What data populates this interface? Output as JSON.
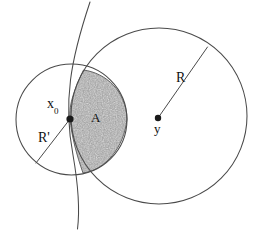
{
  "figure": {
    "background_color": "#ffffff",
    "stroke_color": "#4a4a4a",
    "shade_color": "#9a9a9a",
    "dot_color": "#1a1a1a",
    "width": 257,
    "height": 233
  },
  "labels": {
    "x0_point": "x",
    "x0_subscript": "0",
    "small_radius": "R'",
    "region": "A",
    "large_radius": "R",
    "y_point": "y"
  },
  "geometry": {
    "small_circle": {
      "name": "small-circle",
      "center_x": 71.5,
      "center_y": 119.5,
      "radius": 55.5,
      "radius_label": "R'"
    },
    "large_circle": {
      "name": "large-circle",
      "center_x": 159,
      "center_y": 116,
      "radius": 88,
      "radius_label": "R"
    },
    "boundary_curve": {
      "name": "boundary-curve",
      "description": "vertical arc passing through x0 from top to bottom of frame"
    },
    "shaded_region": {
      "name": "region-A",
      "label": "A",
      "description": "lens shaped intersection bounded left by curve and right by small circle arc"
    },
    "points": [
      {
        "name": "x0",
        "label": "x",
        "subscript": "0",
        "x": 70,
        "y": 119
      },
      {
        "name": "y",
        "label": "y",
        "x": 158,
        "y": 118
      }
    ],
    "radius_lines": [
      {
        "name": "small-radius-line",
        "from_x": 70,
        "from_y": 119,
        "to_x": 36,
        "to_y": 163
      },
      {
        "name": "large-radius-line",
        "from_x": 158,
        "from_y": 118,
        "to_x": 207.5,
        "to_y": 47
      }
    ]
  }
}
